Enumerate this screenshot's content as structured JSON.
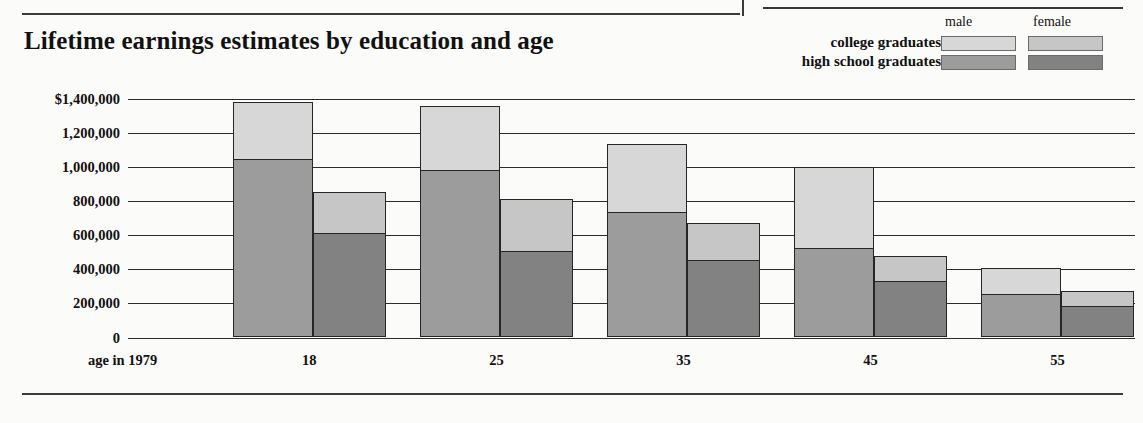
{
  "title": "Lifetime earnings estimates by education and age",
  "legend": {
    "columns": [
      "male",
      "female"
    ],
    "rows": [
      {
        "label": "college graduates",
        "male_color": "#d7d7d7",
        "female_color": "#c6c6c6"
      },
      {
        "label": "high school graduates",
        "male_color": "#9c9c9c",
        "female_color": "#828282"
      }
    ]
  },
  "axis_caption": "age in 1979",
  "chart_data": {
    "type": "bar",
    "title": "Lifetime earnings estimates by education and age",
    "subtype": "grouped-stacked",
    "xlabel": "age in 1979",
    "ylabel": "",
    "categories": [
      "18",
      "25",
      "35",
      "45",
      "55"
    ],
    "ylim": [
      0,
      1400000
    ],
    "yticks": [
      0,
      200000,
      400000,
      600000,
      800000,
      1000000,
      1200000,
      1400000
    ],
    "ytick_labels": [
      "0",
      "200,000",
      "400,000",
      "600,000",
      "800,000",
      "1,000,000",
      "1,200,000",
      "$1,400,000"
    ],
    "grid": true,
    "legend_position": "top-right",
    "series": [
      {
        "name": "high school graduates, male",
        "group": "male",
        "education": "high school",
        "color": "#9c9c9c",
        "values": [
          1050000,
          985000,
          740000,
          530000,
          260000
        ]
      },
      {
        "name": "college graduates, male",
        "group": "male",
        "education": "college",
        "color": "#d7d7d7",
        "values": [
          1380000,
          1355000,
          1135000,
          1000000,
          405000
        ]
      },
      {
        "name": "high school graduates, female",
        "group": "female",
        "education": "high school",
        "color": "#828282",
        "values": [
          620000,
          515000,
          460000,
          335000,
          190000
        ]
      },
      {
        "name": "college graduates, female",
        "group": "female",
        "education": "college",
        "color": "#c6c6c6",
        "values": [
          855000,
          810000,
          670000,
          475000,
          270000
        ]
      }
    ]
  }
}
